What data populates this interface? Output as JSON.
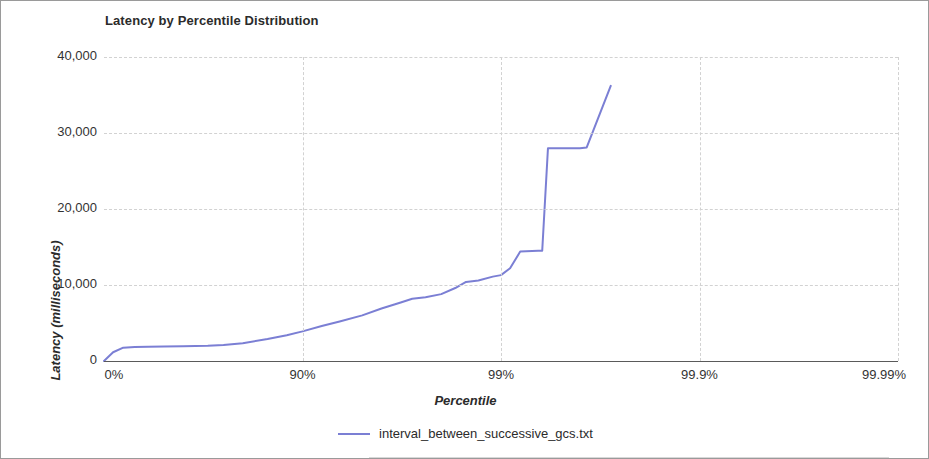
{
  "chart_data": {
    "type": "line",
    "title": "Latency by Percentile Distribution",
    "xlabel": "Percentile",
    "ylabel": "Latency (milliseconds)",
    "xtick_labels": [
      "0%",
      "90%",
      "99%",
      "99.9%",
      "99.99%"
    ],
    "xtick_percentiles": [
      0,
      90,
      99,
      99.9,
      99.99
    ],
    "ytick_labels": [
      "0",
      "10,000",
      "20,000",
      "30,000",
      "40,000"
    ],
    "ytick_values": [
      0,
      10000,
      20000,
      30000,
      40000
    ],
    "ylim": [
      0,
      40000
    ],
    "xscale": "percentile-logarithmic",
    "grid": true,
    "legend_position": "bottom",
    "series": [
      {
        "name": "interval_between_successive_gcs.txt",
        "color": "#7b7fd4",
        "points": [
          {
            "percentile": 0.0,
            "value": 0
          },
          {
            "percentile": 10.0,
            "value": 1150
          },
          {
            "percentile": 20.0,
            "value": 1750
          },
          {
            "percentile": 30.0,
            "value": 1850
          },
          {
            "percentile": 40.0,
            "value": 1880
          },
          {
            "percentile": 50.0,
            "value": 1900
          },
          {
            "percentile": 60.0,
            "value": 1950
          },
          {
            "percentile": 70.0,
            "value": 2000
          },
          {
            "percentile": 75.0,
            "value": 2100
          },
          {
            "percentile": 80.0,
            "value": 2350
          },
          {
            "percentile": 85.0,
            "value": 2900
          },
          {
            "percentile": 88.0,
            "value": 3400
          },
          {
            "percentile": 90.0,
            "value": 3900
          },
          {
            "percentile": 92.0,
            "value": 4600
          },
          {
            "percentile": 93.5,
            "value": 5200
          },
          {
            "percentile": 95.0,
            "value": 6000
          },
          {
            "percentile": 96.0,
            "value": 6900
          },
          {
            "percentile": 96.8,
            "value": 7700
          },
          {
            "percentile": 97.2,
            "value": 8200
          },
          {
            "percentile": 97.6,
            "value": 8400
          },
          {
            "percentile": 98.0,
            "value": 8800
          },
          {
            "percentile": 98.3,
            "value": 9600
          },
          {
            "percentile": 98.5,
            "value": 10400
          },
          {
            "percentile": 98.7,
            "value": 10600
          },
          {
            "percentile": 98.9,
            "value": 11100
          },
          {
            "percentile": 99.0,
            "value": 11300
          },
          {
            "percentile": 99.1,
            "value": 12200
          },
          {
            "percentile": 99.2,
            "value": 14400
          },
          {
            "percentile": 99.35,
            "value": 14500
          },
          {
            "percentile": 99.38,
            "value": 14500
          },
          {
            "percentile": 99.42,
            "value": 28000
          },
          {
            "percentile": 99.6,
            "value": 28000
          },
          {
            "percentile": 99.63,
            "value": 28100
          },
          {
            "percentile": 99.72,
            "value": 36200
          }
        ]
      }
    ]
  },
  "legend": {
    "label": "interval_between_successive_gcs.txt"
  }
}
